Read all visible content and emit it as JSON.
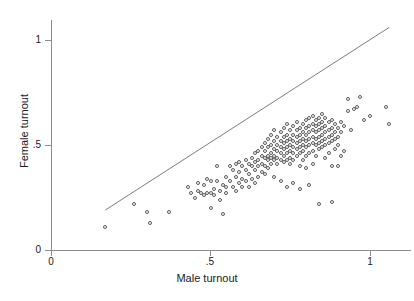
{
  "chart_data": {
    "type": "scatter",
    "title": "",
    "xlabel": "Male turnout",
    "ylabel": "Female turnout",
    "xlim": [
      0,
      1.13
    ],
    "ylim": [
      0,
      1.1
    ],
    "xticks": [
      0,
      0.5,
      1
    ],
    "xticklabels": [
      "0",
      ".5",
      "1"
    ],
    "yticks": [
      0,
      0.5,
      1
    ],
    "yticklabels": [
      "0",
      ".5",
      "1"
    ],
    "grid": false,
    "legend": null,
    "marker": "open-circle",
    "marker_color": "#5a5a5a",
    "reference_line": {
      "name": "identity-line",
      "equation": "y = x",
      "x_start": 0.17,
      "y_start": 0.19,
      "x_end": 1.06,
      "y_end": 1.06,
      "color": "#6e6e6e"
    },
    "n_points": 218,
    "points": [
      [
        0.17,
        0.11
      ],
      [
        0.26,
        0.22
      ],
      [
        0.3,
        0.18
      ],
      [
        0.31,
        0.13
      ],
      [
        0.37,
        0.18
      ],
      [
        0.43,
        0.3
      ],
      [
        0.44,
        0.27
      ],
      [
        0.45,
        0.25
      ],
      [
        0.46,
        0.28
      ],
      [
        0.46,
        0.32
      ],
      [
        0.47,
        0.27
      ],
      [
        0.48,
        0.26
      ],
      [
        0.48,
        0.31
      ],
      [
        0.49,
        0.27
      ],
      [
        0.49,
        0.34
      ],
      [
        0.5,
        0.27
      ],
      [
        0.5,
        0.33
      ],
      [
        0.5,
        0.2
      ],
      [
        0.51,
        0.29
      ],
      [
        0.51,
        0.26
      ],
      [
        0.52,
        0.33
      ],
      [
        0.52,
        0.4
      ],
      [
        0.53,
        0.28
      ],
      [
        0.53,
        0.24
      ],
      [
        0.54,
        0.31
      ],
      [
        0.54,
        0.17
      ],
      [
        0.55,
        0.3
      ],
      [
        0.55,
        0.27
      ],
      [
        0.55,
        0.35
      ],
      [
        0.56,
        0.4
      ],
      [
        0.56,
        0.33
      ],
      [
        0.57,
        0.38
      ],
      [
        0.57,
        0.3
      ],
      [
        0.58,
        0.41
      ],
      [
        0.58,
        0.35
      ],
      [
        0.58,
        0.28
      ],
      [
        0.59,
        0.42
      ],
      [
        0.59,
        0.37
      ],
      [
        0.59,
        0.32
      ],
      [
        0.6,
        0.4
      ],
      [
        0.6,
        0.34
      ],
      [
        0.6,
        0.3
      ],
      [
        0.61,
        0.43
      ],
      [
        0.61,
        0.38
      ],
      [
        0.61,
        0.33
      ],
      [
        0.62,
        0.41
      ],
      [
        0.62,
        0.36
      ],
      [
        0.62,
        0.3
      ],
      [
        0.63,
        0.44
      ],
      [
        0.63,
        0.4
      ],
      [
        0.63,
        0.34
      ],
      [
        0.64,
        0.46
      ],
      [
        0.64,
        0.42
      ],
      [
        0.64,
        0.38
      ],
      [
        0.64,
        0.32
      ],
      [
        0.65,
        0.47
      ],
      [
        0.65,
        0.43
      ],
      [
        0.65,
        0.4
      ],
      [
        0.65,
        0.35
      ],
      [
        0.66,
        0.49
      ],
      [
        0.66,
        0.45
      ],
      [
        0.66,
        0.41
      ],
      [
        0.66,
        0.37
      ],
      [
        0.67,
        0.51
      ],
      [
        0.67,
        0.47
      ],
      [
        0.67,
        0.44
      ],
      [
        0.67,
        0.4
      ],
      [
        0.67,
        0.36
      ],
      [
        0.68,
        0.53
      ],
      [
        0.68,
        0.49
      ],
      [
        0.68,
        0.45
      ],
      [
        0.68,
        0.43
      ],
      [
        0.68,
        0.39
      ],
      [
        0.69,
        0.55
      ],
      [
        0.69,
        0.5
      ],
      [
        0.69,
        0.46
      ],
      [
        0.69,
        0.44
      ],
      [
        0.69,
        0.41
      ],
      [
        0.7,
        0.57
      ],
      [
        0.7,
        0.52
      ],
      [
        0.7,
        0.48
      ],
      [
        0.7,
        0.45
      ],
      [
        0.7,
        0.43
      ],
      [
        0.7,
        0.35
      ],
      [
        0.71,
        0.54
      ],
      [
        0.71,
        0.5
      ],
      [
        0.71,
        0.47
      ],
      [
        0.71,
        0.44
      ],
      [
        0.71,
        0.41
      ],
      [
        0.72,
        0.56
      ],
      [
        0.72,
        0.52
      ],
      [
        0.72,
        0.49
      ],
      [
        0.72,
        0.46
      ],
      [
        0.72,
        0.43
      ],
      [
        0.72,
        0.33
      ],
      [
        0.73,
        0.58
      ],
      [
        0.73,
        0.54
      ],
      [
        0.73,
        0.51
      ],
      [
        0.73,
        0.48
      ],
      [
        0.73,
        0.45
      ],
      [
        0.73,
        0.42
      ],
      [
        0.74,
        0.6
      ],
      [
        0.74,
        0.55
      ],
      [
        0.74,
        0.52
      ],
      [
        0.74,
        0.49
      ],
      [
        0.74,
        0.46
      ],
      [
        0.74,
        0.43
      ],
      [
        0.74,
        0.3
      ],
      [
        0.75,
        0.57
      ],
      [
        0.75,
        0.53
      ],
      [
        0.75,
        0.5
      ],
      [
        0.75,
        0.47
      ],
      [
        0.75,
        0.44
      ],
      [
        0.75,
        0.41
      ],
      [
        0.76,
        0.59
      ],
      [
        0.76,
        0.55
      ],
      [
        0.76,
        0.52
      ],
      [
        0.76,
        0.49
      ],
      [
        0.76,
        0.46
      ],
      [
        0.76,
        0.43
      ],
      [
        0.76,
        0.32
      ],
      [
        0.77,
        0.61
      ],
      [
        0.77,
        0.57
      ],
      [
        0.77,
        0.54
      ],
      [
        0.77,
        0.51
      ],
      [
        0.77,
        0.48
      ],
      [
        0.77,
        0.45
      ],
      [
        0.78,
        0.58
      ],
      [
        0.78,
        0.55
      ],
      [
        0.78,
        0.52
      ],
      [
        0.78,
        0.49
      ],
      [
        0.78,
        0.46
      ],
      [
        0.78,
        0.4
      ],
      [
        0.78,
        0.29
      ],
      [
        0.79,
        0.6
      ],
      [
        0.79,
        0.56
      ],
      [
        0.79,
        0.53
      ],
      [
        0.79,
        0.5
      ],
      [
        0.79,
        0.47
      ],
      [
        0.79,
        0.43
      ],
      [
        0.8,
        0.62
      ],
      [
        0.8,
        0.58
      ],
      [
        0.8,
        0.55
      ],
      [
        0.8,
        0.52
      ],
      [
        0.8,
        0.49
      ],
      [
        0.8,
        0.45
      ],
      [
        0.8,
        0.39
      ],
      [
        0.81,
        0.63
      ],
      [
        0.81,
        0.59
      ],
      [
        0.81,
        0.56
      ],
      [
        0.81,
        0.53
      ],
      [
        0.81,
        0.5
      ],
      [
        0.81,
        0.46
      ],
      [
        0.81,
        0.31
      ],
      [
        0.82,
        0.64
      ],
      [
        0.82,
        0.6
      ],
      [
        0.82,
        0.57
      ],
      [
        0.82,
        0.54
      ],
      [
        0.82,
        0.51
      ],
      [
        0.82,
        0.47
      ],
      [
        0.82,
        0.41
      ],
      [
        0.83,
        0.62
      ],
      [
        0.83,
        0.59
      ],
      [
        0.83,
        0.56
      ],
      [
        0.83,
        0.53
      ],
      [
        0.83,
        0.5
      ],
      [
        0.83,
        0.45
      ],
      [
        0.84,
        0.63
      ],
      [
        0.84,
        0.6
      ],
      [
        0.84,
        0.57
      ],
      [
        0.84,
        0.54
      ],
      [
        0.84,
        0.51
      ],
      [
        0.84,
        0.48
      ],
      [
        0.84,
        0.22
      ],
      [
        0.85,
        0.65
      ],
      [
        0.85,
        0.61
      ],
      [
        0.85,
        0.58
      ],
      [
        0.85,
        0.55
      ],
      [
        0.85,
        0.52
      ],
      [
        0.85,
        0.49
      ],
      [
        0.86,
        0.63
      ],
      [
        0.86,
        0.59
      ],
      [
        0.86,
        0.56
      ],
      [
        0.86,
        0.53
      ],
      [
        0.86,
        0.5
      ],
      [
        0.86,
        0.44
      ],
      [
        0.87,
        0.61
      ],
      [
        0.87,
        0.57
      ],
      [
        0.87,
        0.54
      ],
      [
        0.87,
        0.51
      ],
      [
        0.87,
        0.46
      ],
      [
        0.88,
        0.62
      ],
      [
        0.88,
        0.58
      ],
      [
        0.88,
        0.55
      ],
      [
        0.88,
        0.52
      ],
      [
        0.88,
        0.4
      ],
      [
        0.88,
        0.23
      ],
      [
        0.89,
        0.6
      ],
      [
        0.89,
        0.56
      ],
      [
        0.89,
        0.53
      ],
      [
        0.89,
        0.48
      ],
      [
        0.9,
        0.58
      ],
      [
        0.9,
        0.54
      ],
      [
        0.9,
        0.5
      ],
      [
        0.9,
        0.4
      ],
      [
        0.91,
        0.61
      ],
      [
        0.91,
        0.56
      ],
      [
        0.91,
        0.45
      ],
      [
        0.92,
        0.59
      ],
      [
        0.92,
        0.47
      ],
      [
        0.93,
        0.72
      ],
      [
        0.93,
        0.66
      ],
      [
        0.94,
        0.57
      ],
      [
        0.95,
        0.67
      ],
      [
        0.96,
        0.68
      ],
      [
        0.97,
        0.73
      ],
      [
        0.98,
        0.62
      ],
      [
        1.0,
        0.64
      ],
      [
        1.05,
        0.68
      ],
      [
        1.06,
        0.6
      ]
    ]
  }
}
